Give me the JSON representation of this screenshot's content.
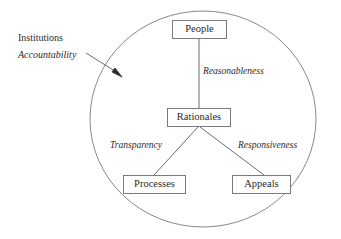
{
  "diagram": {
    "background_color": "#ffffff",
    "stroke_color": "#7a7a7a",
    "text_color": "#2b2b2b",
    "boundary": {
      "shape": "ellipse",
      "center_x": 203,
      "center_y": 119,
      "radius_x": 113,
      "radius_y": 108
    },
    "outside_labels": [
      {
        "id": "institutions",
        "text": "Institutions",
        "style": "roman"
      },
      {
        "id": "accountability",
        "text": "Accountability",
        "style": "italic"
      }
    ],
    "pointer": {
      "type": "arrow",
      "from_x": 86,
      "from_y": 53,
      "to_x": 122,
      "to_y": 76,
      "head": "filled-triangle"
    },
    "nodes": [
      {
        "id": "people",
        "label": "People"
      },
      {
        "id": "rationales",
        "label": "Rationales"
      },
      {
        "id": "processes",
        "label": "Processes"
      },
      {
        "id": "appeals",
        "label": "Appeals"
      }
    ],
    "edges": [
      {
        "id": "people-rationales",
        "from": "people",
        "to": "rationales",
        "label": "Reasonableness"
      },
      {
        "id": "rationales-processes",
        "from": "rationales",
        "to": "processes",
        "label": "Transparency"
      },
      {
        "id": "rationales-appeals",
        "from": "rationales",
        "to": "appeals",
        "label": "Responsiveness"
      }
    ]
  }
}
